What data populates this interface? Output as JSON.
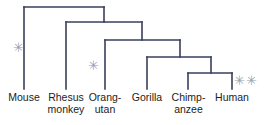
{
  "figure": {
    "background_color": "#ffffff",
    "width": 265,
    "height": 125
  },
  "style": {
    "branch_color": "#3a3f5c",
    "branch_width": 1.6,
    "label_color": "#1c1c1c",
    "marker_color": "#9aa0b4"
  },
  "taxa": [
    {
      "id": "mouse",
      "label": "Mouse",
      "tip_x": 24,
      "tip_y": 89
    },
    {
      "id": "rhesus",
      "label": "Rhesus\nmonkey",
      "tip_x": 66,
      "tip_y": 89
    },
    {
      "id": "orangutan",
      "label": "Orang-\nutan",
      "tip_x": 105,
      "tip_y": 89
    },
    {
      "id": "gorilla",
      "label": "Gorilla",
      "tip_x": 147,
      "tip_y": 89
    },
    {
      "id": "chimpanzee",
      "label": "Chimp-\nanzee",
      "tip_x": 188,
      "tip_y": 89
    },
    {
      "id": "human",
      "label": "Human",
      "tip_x": 232,
      "tip_y": 89
    }
  ],
  "nodes": [
    {
      "id": "node-root",
      "label": "mouse / primate split",
      "depth_y": 7,
      "left_x": 24,
      "right_x": 104
    },
    {
      "id": "node-catarrhini",
      "label": "rhesus / ape split",
      "depth_y": 22,
      "left_x": 66,
      "right_x": 142
    },
    {
      "id": "node-hominid",
      "label": "orangutan / great ape split",
      "depth_y": 40,
      "left_x": 105,
      "right_x": 180
    },
    {
      "id": "node-homininae",
      "label": "gorilla / chimp-human split",
      "depth_y": 57,
      "left_x": 147,
      "right_x": 211
    },
    {
      "id": "node-hominini",
      "label": "chimpanzee / human split",
      "depth_y": 73,
      "left_x": 188,
      "right_x": 232
    }
  ],
  "stems": [
    {
      "id": "stem-catarrhini",
      "from_node": "node-catarrhini",
      "x": 104,
      "y_top": 7,
      "y_bottom": 22
    },
    {
      "id": "stem-hominid",
      "from_node": "node-hominid",
      "x": 142,
      "y_top": 22,
      "y_bottom": 40
    },
    {
      "id": "stem-homininae",
      "from_node": "node-homininae",
      "x": 180,
      "y_top": 40,
      "y_bottom": 57
    },
    {
      "id": "stem-hominini",
      "from_node": "node-hominini",
      "x": 211,
      "y_top": 57,
      "y_bottom": 73
    }
  ],
  "markers": [
    {
      "id": "marker-root",
      "glyph": "✳",
      "x": 13,
      "y": 41,
      "size": 13,
      "count": 1,
      "near": "mouse branch"
    },
    {
      "id": "marker-mid",
      "glyph": "✳",
      "x": 88,
      "y": 59,
      "size": 13,
      "count": 1,
      "near": "orangutan branch"
    },
    {
      "id": "marker-tip",
      "glyph": "✳✳",
      "x": 234,
      "y": 74,
      "size": 13,
      "count": 2,
      "near": "human branch"
    }
  ]
}
